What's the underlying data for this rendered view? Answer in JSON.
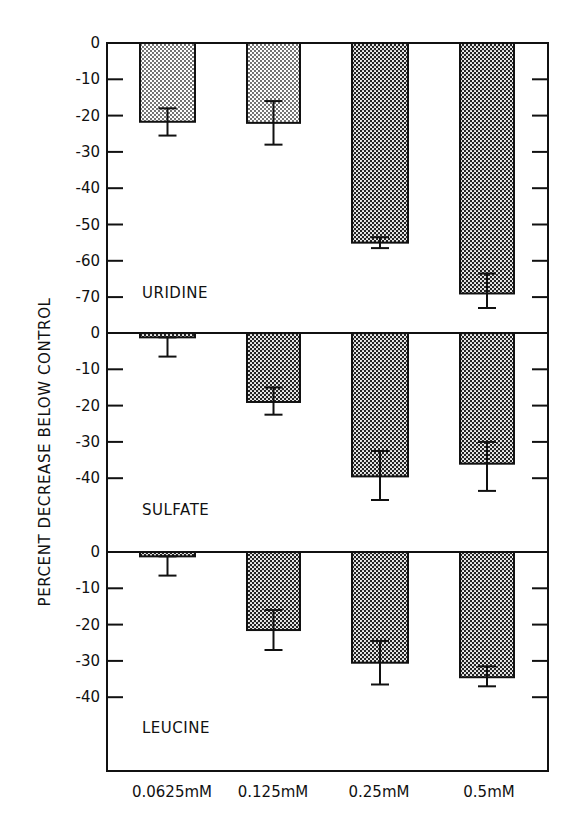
{
  "chart_data": {
    "type": "bar",
    "title": "",
    "xlabel": "",
    "ylabel": "PERCENT DECREASE BELOW CONTROL",
    "categories": [
      "0.0625mM",
      "0.125mM",
      "0.25mM",
      "0.5mM"
    ],
    "grid": false,
    "legend": "none",
    "panels": [
      {
        "name": "URIDINE",
        "ylim": [
          -80,
          0
        ],
        "yticks": [
          0,
          -10,
          -20,
          -30,
          -40,
          -50,
          -60,
          -70
        ],
        "tick_labels": [
          "0",
          "-10",
          "-20",
          "-30",
          "-40",
          "-50",
          "-60",
          "-70"
        ],
        "values": [
          -21.7,
          -22,
          -55,
          -69
        ],
        "error_low": [
          -25.5,
          -28,
          -56.5,
          -73
        ],
        "error_high": [
          -18,
          -16,
          -53.5,
          -63.5
        ]
      },
      {
        "name": "SULFATE",
        "ylim": [
          -60,
          0
        ],
        "yticks": [
          0,
          -10,
          -20,
          -30,
          -40
        ],
        "tick_labels": [
          "0",
          "-10",
          "-20",
          "-30",
          "-40"
        ],
        "values": [
          -1.2,
          -19,
          -39.5,
          -36
        ],
        "error_low": [
          -6.5,
          -22.5,
          -46,
          -43.5
        ],
        "error_high": [
          -1.2,
          -15,
          -32.5,
          -30
        ]
      },
      {
        "name": "LEUCINE",
        "ylim": [
          -60,
          0
        ],
        "yticks": [
          0,
          -10,
          -20,
          -30,
          -40
        ],
        "tick_labels": [
          "0",
          "-10",
          "-20",
          "-30",
          "-40"
        ],
        "values": [
          -1.2,
          -21.5,
          -30.5,
          -34.5
        ],
        "error_low": [
          -6.5,
          -27,
          -36.5,
          -37
        ],
        "error_high": [
          -1.2,
          -16,
          -24.5,
          -31.5
        ]
      }
    ]
  },
  "colors": {
    "ink": "#111111",
    "background": "#ffffff",
    "bar_fill_light": "#bdbdbd",
    "bar_fill_dark": "#7a7a7a"
  }
}
